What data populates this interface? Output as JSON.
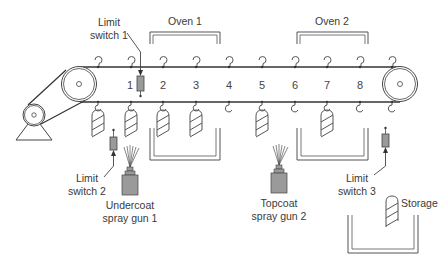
{
  "diagram": {
    "type": "conveyor-painting-system",
    "labels": {
      "limit_switch_1": [
        "Limit",
        "switch 1"
      ],
      "limit_switch_2": [
        "Limit",
        "switch 2"
      ],
      "limit_switch_3": [
        "Limit",
        "switch 3"
      ],
      "oven_1": "Oven 1",
      "oven_2": "Oven 2",
      "undercoat_gun": [
        "Undercoat",
        "spray gun 1"
      ],
      "topcoat_gun": [
        "Topcoat",
        "spray gun 2"
      ],
      "storage": "Storage"
    },
    "stations": [
      "1",
      "2",
      "3",
      "4",
      "5",
      "6",
      "7",
      "8"
    ],
    "colors": {
      "line": "#333333",
      "device_fill": "#9a9a9a",
      "text": "#3a3a3a"
    }
  }
}
